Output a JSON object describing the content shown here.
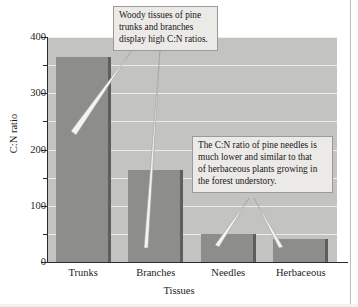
{
  "figure": {
    "caption_note": "",
    "background_color": "#ffffff"
  },
  "chart_data": {
    "type": "bar",
    "title": "",
    "subtitle": "",
    "xlabel": "Tissues",
    "ylabel": "C:N ratio",
    "categories": [
      "Trunks",
      "Branches",
      "Needles",
      "Herbaceous"
    ],
    "values": [
      365,
      163,
      50,
      41
    ],
    "series": [
      {
        "name": "C:N ratio",
        "values": [
          365,
          163,
          50,
          41
        ]
      }
    ],
    "ylim": [
      0,
      400
    ],
    "ytick_labels": [
      "0",
      "100",
      "200",
      "300",
      "400"
    ],
    "ytick_values": [
      0,
      100,
      200,
      300,
      400
    ],
    "minor_tick_values": [
      50,
      150,
      250,
      350
    ],
    "gridline_values": [
      50,
      100,
      150,
      200,
      250,
      300,
      350,
      400
    ],
    "grid": true,
    "grid_color": "#ededea",
    "legend": false,
    "legend_position": "none",
    "bar_color": "#8d8d8b",
    "bar_edge_color": "#5e5e5c",
    "plot_background_color": "#c3c3c1",
    "axis_color": "#2b2b2b",
    "annotations": [
      {
        "id": "callout-woody",
        "text": "Woody tissues of pine trunks and branches display high C:N ratios.",
        "lines": [
          "Woody tissues of pine",
          "trunks and branches",
          "display high C:N ratios."
        ],
        "points_to": [
          "Trunks",
          "Branches"
        ]
      },
      {
        "id": "callout-needles",
        "text": "The C:N ratio of pine needles is much lower and similar to that of herbaceous plants growing in the forest understory.",
        "lines": [
          "The C:N ratio of pine needles is",
          "much lower and similar to that",
          "of herbaceous plants growing in",
          "the forest understory."
        ],
        "points_to": [
          "Needles",
          "Herbaceous"
        ]
      }
    ]
  }
}
